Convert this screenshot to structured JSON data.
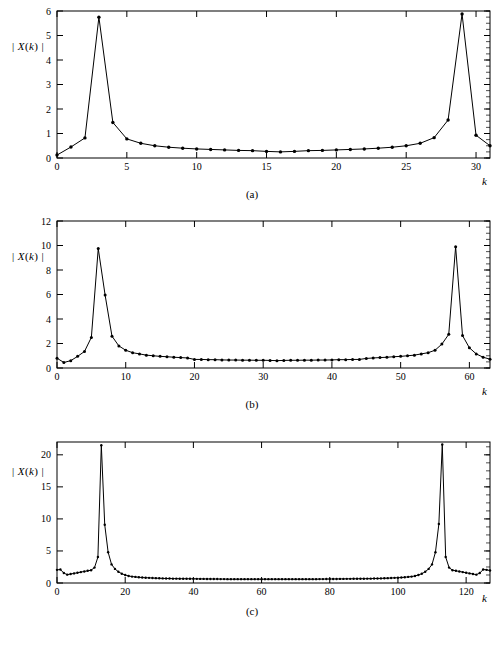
{
  "figure": {
    "ylabel_text": "| X(k) |",
    "xlabel_text": "k",
    "panels": [
      {
        "caption": "(a)"
      },
      {
        "caption": "(b)"
      },
      {
        "caption": "(c)"
      }
    ]
  },
  "chart_data": [
    {
      "type": "line",
      "title": "",
      "subtitle": "(a)",
      "xlabel": "k",
      "ylabel": "| X(k) |",
      "xlim": [
        0,
        31
      ],
      "ylim": [
        0,
        6
      ],
      "xticks": [
        0,
        5,
        10,
        15,
        20,
        25,
        30
      ],
      "yticks": [
        0,
        1,
        2,
        3,
        4,
        5,
        6
      ],
      "grid": false,
      "legend": "none",
      "markers": true,
      "N": 32,
      "x": [
        0,
        1,
        2,
        3,
        4,
        5,
        6,
        7,
        8,
        9,
        10,
        11,
        12,
        13,
        14,
        15,
        16,
        17,
        18,
        19,
        20,
        21,
        22,
        23,
        24,
        25,
        26,
        27,
        28,
        29,
        30,
        31
      ],
      "values": [
        0.12,
        0.45,
        0.82,
        5.75,
        1.45,
        0.78,
        0.6,
        0.5,
        0.44,
        0.4,
        0.37,
        0.35,
        0.33,
        0.31,
        0.3,
        0.27,
        0.25,
        0.27,
        0.3,
        0.31,
        0.33,
        0.35,
        0.37,
        0.4,
        0.44,
        0.5,
        0.6,
        0.83,
        1.55,
        5.88,
        0.93,
        0.5
      ]
    },
    {
      "type": "line",
      "title": "",
      "subtitle": "(b)",
      "xlabel": "k",
      "ylabel": "| X(k) |",
      "xlim": [
        0,
        63
      ],
      "ylim": [
        0,
        12
      ],
      "xticks": [
        0,
        10,
        20,
        30,
        40,
        50,
        60
      ],
      "yticks": [
        0,
        2,
        4,
        6,
        8,
        10,
        12
      ],
      "grid": false,
      "legend": "none",
      "markers": true,
      "N": 64,
      "x": [
        0,
        1,
        2,
        3,
        4,
        5,
        6,
        7,
        8,
        9,
        10,
        11,
        12,
        13,
        14,
        15,
        16,
        17,
        18,
        19,
        20,
        21,
        22,
        23,
        24,
        25,
        26,
        27,
        28,
        29,
        30,
        31,
        32,
        33,
        34,
        35,
        36,
        37,
        38,
        39,
        40,
        41,
        42,
        43,
        44,
        45,
        46,
        47,
        48,
        49,
        50,
        51,
        52,
        53,
        54,
        55,
        56,
        57,
        58,
        59,
        60,
        61,
        62,
        63
      ],
      "values": [
        0.8,
        0.45,
        0.6,
        0.95,
        1.35,
        2.5,
        9.75,
        5.95,
        2.6,
        1.8,
        1.45,
        1.25,
        1.15,
        1.05,
        1.0,
        0.95,
        0.92,
        0.88,
        0.85,
        0.82,
        0.7,
        0.7,
        0.68,
        0.68,
        0.66,
        0.65,
        0.65,
        0.64,
        0.64,
        0.63,
        0.63,
        0.62,
        0.6,
        0.62,
        0.63,
        0.63,
        0.64,
        0.64,
        0.65,
        0.65,
        0.66,
        0.68,
        0.68,
        0.7,
        0.7,
        0.78,
        0.82,
        0.85,
        0.88,
        0.92,
        0.95,
        1.0,
        1.05,
        1.15,
        1.25,
        1.45,
        1.95,
        2.75,
        9.9,
        2.65,
        1.65,
        1.15,
        0.88,
        0.72
      ]
    },
    {
      "type": "line",
      "title": "",
      "subtitle": "(c)",
      "xlabel": "k",
      "ylabel": "| X(k) |",
      "xlim": [
        0,
        127
      ],
      "ylim": [
        0,
        22
      ],
      "xticks": [
        0,
        20,
        40,
        60,
        80,
        100,
        120
      ],
      "yticks": [
        0,
        5,
        10,
        15,
        20
      ],
      "grid": false,
      "legend": "none",
      "markers": true,
      "N": 128,
      "x": [
        0,
        1,
        2,
        3,
        4,
        5,
        6,
        7,
        8,
        9,
        10,
        11,
        12,
        13,
        14,
        15,
        16,
        17,
        18,
        19,
        20,
        21,
        22,
        23,
        24,
        25,
        26,
        27,
        28,
        29,
        30,
        31,
        32,
        33,
        34,
        35,
        36,
        37,
        38,
        39,
        40,
        41,
        42,
        43,
        44,
        45,
        46,
        47,
        48,
        49,
        50,
        51,
        52,
        53,
        54,
        55,
        56,
        57,
        58,
        59,
        60,
        61,
        62,
        63,
        64,
        65,
        66,
        67,
        68,
        69,
        70,
        71,
        72,
        73,
        74,
        75,
        76,
        77,
        78,
        79,
        80,
        81,
        82,
        83,
        84,
        85,
        86,
        87,
        88,
        89,
        90,
        91,
        92,
        93,
        94,
        95,
        96,
        97,
        98,
        99,
        100,
        101,
        102,
        103,
        104,
        105,
        106,
        107,
        108,
        109,
        110,
        111,
        112,
        113,
        114,
        115,
        116,
        117,
        118,
        119,
        120,
        121,
        122,
        123,
        124,
        125,
        126,
        127
      ],
      "values": [
        2.05,
        2.1,
        1.55,
        1.3,
        1.4,
        1.5,
        1.6,
        1.7,
        1.8,
        1.9,
        2.0,
        2.4,
        4.05,
        21.5,
        9.1,
        4.8,
        2.9,
        2.2,
        1.75,
        1.45,
        1.25,
        1.1,
        1.0,
        0.95,
        0.9,
        0.85,
        0.82,
        0.8,
        0.78,
        0.76,
        0.74,
        0.72,
        0.7,
        0.7,
        0.68,
        0.68,
        0.67,
        0.67,
        0.66,
        0.66,
        0.65,
        0.65,
        0.64,
        0.64,
        0.63,
        0.63,
        0.62,
        0.62,
        0.61,
        0.61,
        0.6,
        0.6,
        0.6,
        0.6,
        0.6,
        0.6,
        0.6,
        0.6,
        0.6,
        0.6,
        0.6,
        0.6,
        0.6,
        0.6,
        0.6,
        0.6,
        0.6,
        0.6,
        0.6,
        0.6,
        0.6,
        0.6,
        0.6,
        0.6,
        0.6,
        0.6,
        0.6,
        0.61,
        0.61,
        0.62,
        0.62,
        0.63,
        0.63,
        0.64,
        0.64,
        0.65,
        0.65,
        0.66,
        0.66,
        0.67,
        0.67,
        0.68,
        0.68,
        0.7,
        0.7,
        0.72,
        0.74,
        0.76,
        0.78,
        0.8,
        0.82,
        0.85,
        0.9,
        0.95,
        1.0,
        1.1,
        1.25,
        1.45,
        1.75,
        2.2,
        2.9,
        4.8,
        9.2,
        21.6,
        4.05,
        2.4,
        2.0,
        1.9,
        1.8,
        1.7,
        1.6,
        1.5,
        1.4,
        1.3,
        1.55,
        2.1,
        2.05,
        1.95
      ]
    }
  ]
}
